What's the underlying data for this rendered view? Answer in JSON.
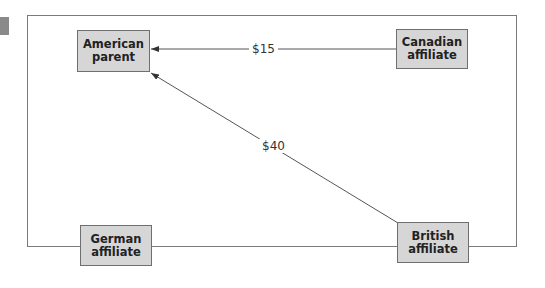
{
  "diagram": {
    "type": "flow-diagram",
    "nodes": {
      "american_parent": {
        "label": "American\nparent"
      },
      "canadian_affiliate": {
        "label": "Canadian\naffiliate"
      },
      "german_affiliate": {
        "label": "German\naffiliate"
      },
      "british_affiliate": {
        "label": "British\naffiliate"
      }
    },
    "edges": [
      {
        "from": "Canadian affiliate",
        "to": "American parent",
        "label": "$15"
      },
      {
        "from": "British affiliate",
        "to": "American parent",
        "label": "$40"
      }
    ]
  },
  "colors": {
    "node_fill": "#d6d6d6",
    "node_border": "#6f6f6f",
    "edge": "#555555",
    "frame_border": "#7a7a7a"
  }
}
